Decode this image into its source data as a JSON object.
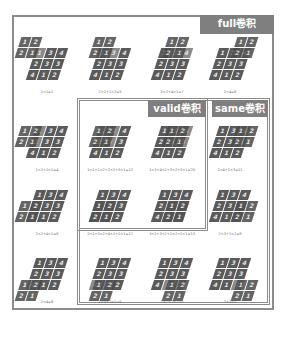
{
  "labels": {
    "full": "full卷积",
    "valid": "valid卷积",
    "same": "same卷积"
  },
  "colors": {
    "frame": "#8c8c8c",
    "label_bg": "#7f7f7f",
    "cell": "#5a5a5a",
    "kernel": "#4a4a4a",
    "overlap": "#8a8a8a",
    "text": "#ffffff"
  },
  "input_matrix": [
    [
      "1",
      "3",
      "4"
    ],
    [
      "2",
      "3",
      "3"
    ],
    [
      "4",
      "1",
      "2"
    ]
  ],
  "kernel_matrix": [
    [
      "1",
      "2"
    ],
    [
      "2",
      "1"
    ]
  ],
  "cells": [
    {
      "row": 0,
      "col": 0,
      "formula": "1×1=1"
    },
    {
      "row": 0,
      "col": 1,
      "formula": "2×1+1×2=5"
    },
    {
      "row": 0,
      "col": 2,
      "formula": "3×2+4×1=7"
    },
    {
      "row": 0,
      "col": 3,
      "formula": "2×4=8"
    },
    {
      "row": 1,
      "col": 0,
      "formula": "1×2+1×1=4"
    },
    {
      "row": 1,
      "col": 1,
      "formula": "1×1+1×2+2×2+3×1=12"
    },
    {
      "row": 1,
      "col": 2,
      "formula": "1×3+4×2+3×2+3×1=20"
    },
    {
      "row": 1,
      "col": 3,
      "formula": "2×4+1×3=11"
    },
    {
      "row": 2,
      "col": 0,
      "formula": "2×2+4×1=8"
    },
    {
      "row": 2,
      "col": 1,
      "formula": "2×1+3×2+4×2+1×1=17"
    },
    {
      "row": 2,
      "col": 2,
      "formula": "3×1+3×2+1×2+2×1=13"
    },
    {
      "row": 2,
      "col": 3,
      "formula": "2×3+1×2=8"
    },
    {
      "row": 3,
      "col": 0,
      "formula": "2×4=8"
    },
    {
      "row": 3,
      "col": 1,
      "formula": "1×4+2×1=6"
    },
    {
      "row": 3,
      "col": 2,
      "formula": "1×1+2×2=5"
    },
    {
      "row": 3,
      "col": 3,
      "formula": "2×1=2"
    }
  ]
}
